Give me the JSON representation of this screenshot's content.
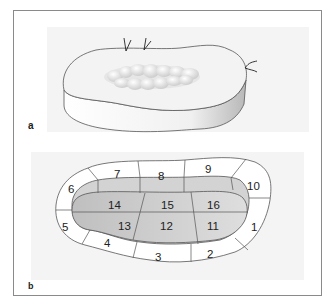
{
  "figure": {
    "panels": [
      {
        "label": "a",
        "description": "3D oblique view of a kidney-shaped slab (organ slice) with a central irregular bumpy mass and three suture/marker threads on the edge"
      },
      {
        "label": "b",
        "description": "Top view of the same slab divided into numbered segments: peripheral rim segments 1–10, darker inner segments 11–16",
        "segments": {
          "outer_rim": [
            "1",
            "2",
            "3",
            "4",
            "5",
            "6",
            "7",
            "8",
            "9",
            "10"
          ],
          "inner": [
            "11",
            "12",
            "13",
            "14",
            "15",
            "16"
          ]
        }
      }
    ]
  },
  "colors": {
    "frame": "#8a8a8a",
    "panel_bg": "#f4f4f4",
    "outline": "#555555",
    "slab_top": "#f2f2f2",
    "slab_side_light": "#ffffff",
    "slab_side_shadow": "#bdbdbd",
    "rim_fill": "#ffffff",
    "middle_band": "#d2d2d2",
    "inner_light": "#dcdcdc",
    "inner_dark": "#c4c4c4"
  }
}
